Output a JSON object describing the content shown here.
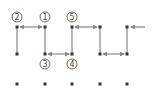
{
  "diagram": {
    "type": "grid-path",
    "colors": {
      "dot": "#333333",
      "line": "#888888",
      "label": "#444444"
    },
    "grid": {
      "columns_x": [
        17,
        45,
        72,
        100,
        127
      ],
      "rows_y": [
        27,
        54,
        84
      ]
    },
    "labels": [
      {
        "text": "2",
        "x": 17,
        "y": 17
      },
      {
        "text": "1",
        "x": 45,
        "y": 17
      },
      {
        "text": "5",
        "x": 72,
        "y": 17
      },
      {
        "text": "3",
        "x": 45,
        "y": 64
      },
      {
        "text": "4",
        "x": 72,
        "y": 64
      }
    ],
    "segments": [
      {
        "x1": 17,
        "y1": 27,
        "x2": 45,
        "y2": 27,
        "arrows": "both"
      },
      {
        "x1": 17,
        "y1": 27,
        "x2": 17,
        "y2": 54,
        "arrows": "none"
      },
      {
        "x1": 45,
        "y1": 27,
        "x2": 45,
        "y2": 54,
        "arrows": "none"
      },
      {
        "x1": 45,
        "y1": 54,
        "x2": 72,
        "y2": 54,
        "arrows": "both"
      },
      {
        "x1": 72,
        "y1": 27,
        "x2": 72,
        "y2": 54,
        "arrows": "none"
      },
      {
        "x1": 72,
        "y1": 27,
        "x2": 100,
        "y2": 27,
        "arrows": "both"
      },
      {
        "x1": 100,
        "y1": 27,
        "x2": 100,
        "y2": 54,
        "arrows": "none"
      },
      {
        "x1": 100,
        "y1": 54,
        "x2": 127,
        "y2": 54,
        "arrows": "both"
      },
      {
        "x1": 127,
        "y1": 27,
        "x2": 127,
        "y2": 54,
        "arrows": "none"
      },
      {
        "x1": 131,
        "y1": 27,
        "x2": 145,
        "y2": 27,
        "arrows": "start"
      }
    ]
  }
}
